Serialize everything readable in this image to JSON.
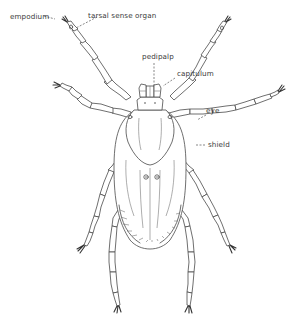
{
  "figure": {
    "labels": {
      "empodium": "empodium",
      "tarsal_sense_organ": "tarsal sense organ",
      "pedipalp": "pedipalp",
      "capitulum": "capitulum",
      "eye": "eye",
      "shield": "shield"
    },
    "colors": {
      "line": "#4a4a4a",
      "text": "#3a3a3a",
      "background": "#ffffff"
    }
  }
}
